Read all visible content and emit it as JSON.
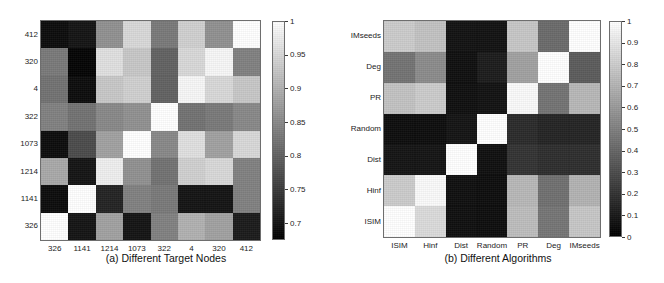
{
  "figure": {
    "background": "#ffffff",
    "colormap": "grayscale-low-dark-to-high-white"
  },
  "panels": [
    {
      "id": "a",
      "caption": "(a) Different Target Nodes",
      "xlabel": "",
      "ylabel": ""
    },
    {
      "id": "b",
      "caption": "(b) Different Algorithms",
      "xlabel": "",
      "ylabel": ""
    }
  ],
  "chart_data": [
    {
      "type": "heatmap",
      "panel": "a",
      "title": "(a) Different Target Nodes",
      "xlabel": "",
      "ylabel": "",
      "x_categories": [
        "326",
        "1141",
        "1214",
        "1073",
        "322",
        "4",
        "320",
        "412"
      ],
      "y_categories": [
        "412",
        "320",
        "4",
        "322",
        "1073",
        "1214",
        "1141",
        "326"
      ],
      "colorbar": {
        "ticks": [
          "1",
          "0.95",
          "0.9",
          "0.85",
          "0.8",
          "0.75",
          "0.7"
        ],
        "tick_values": [
          1,
          0.95,
          0.9,
          0.85,
          0.8,
          0.75,
          0.7
        ],
        "vmin": 0.675,
        "vmax": 1.0,
        "position": "right"
      },
      "values": [
        [
          0.69,
          0.7,
          0.86,
          0.95,
          0.83,
          0.94,
          0.86,
          1.0
        ],
        [
          0.83,
          0.68,
          0.96,
          0.93,
          0.8,
          0.95,
          0.99,
          0.84
        ],
        [
          0.82,
          0.69,
          0.93,
          0.94,
          0.8,
          0.99,
          0.95,
          0.93
        ],
        [
          0.84,
          0.82,
          0.85,
          0.86,
          1.0,
          0.82,
          0.83,
          0.85
        ],
        [
          0.69,
          0.77,
          0.88,
          1.0,
          0.85,
          0.96,
          0.88,
          0.95
        ],
        [
          0.89,
          0.7,
          0.98,
          0.86,
          0.82,
          0.94,
          0.95,
          0.84
        ],
        [
          0.69,
          1.0,
          0.72,
          0.84,
          0.83,
          0.7,
          0.7,
          0.84
        ],
        [
          1.0,
          0.7,
          0.88,
          0.7,
          0.84,
          0.9,
          0.88,
          0.71
        ]
      ]
    },
    {
      "type": "heatmap",
      "panel": "b",
      "title": "(b) Different Algorithms",
      "xlabel": "",
      "ylabel": "",
      "x_categories": [
        "ISIM",
        "Hinf",
        "Dist",
        "Random",
        "PR",
        "Deg",
        "IMseeds"
      ],
      "y_categories": [
        "IMseeds",
        "Deg",
        "PR",
        "Random",
        "Dist",
        "Hinf",
        "ISIM"
      ],
      "colorbar": {
        "ticks": [
          "1",
          "0.9",
          "0.8",
          "0.7",
          "0.6",
          "0.5",
          "0.4",
          "0.3",
          "0.2",
          "0.1",
          "0"
        ],
        "tick_values": [
          1,
          0.9,
          0.8,
          0.7,
          0.6,
          0.5,
          0.4,
          0.3,
          0.2,
          0.1,
          0
        ],
        "vmin": 0.0,
        "vmax": 1.0,
        "position": "right"
      },
      "values": [
        [
          0.8,
          0.76,
          0.07,
          0.07,
          0.78,
          0.42,
          1.0
        ],
        [
          0.45,
          0.55,
          0.06,
          0.11,
          0.63,
          1.0,
          0.36
        ],
        [
          0.76,
          0.8,
          0.06,
          0.07,
          0.98,
          0.45,
          0.72
        ],
        [
          0.05,
          0.05,
          0.08,
          1.0,
          0.17,
          0.14,
          0.14
        ],
        [
          0.08,
          0.08,
          1.0,
          0.06,
          0.2,
          0.18,
          0.18
        ],
        [
          0.8,
          0.98,
          0.06,
          0.05,
          0.72,
          0.44,
          0.7
        ],
        [
          1.0,
          0.86,
          0.06,
          0.05,
          0.74,
          0.46,
          0.78
        ]
      ]
    }
  ]
}
